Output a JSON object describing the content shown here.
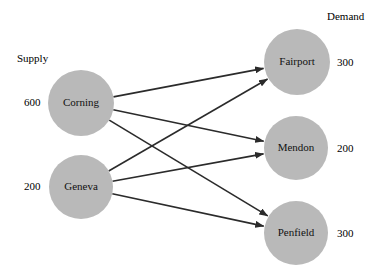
{
  "diagram": {
    "title_supply": "Supply",
    "title_demand": "Demand",
    "supply_nodes": [
      {
        "id": "corning",
        "label": "Corning",
        "value": "600",
        "cx": 81,
        "cy": 103,
        "r": 33
      },
      {
        "id": "geneva",
        "label": "Geneva",
        "value": "200",
        "cx": 81,
        "cy": 187,
        "r": 32
      }
    ],
    "demand_nodes": [
      {
        "id": "fairport",
        "label": "Fairport",
        "value": "300",
        "cx": 297,
        "cy": 62,
        "r": 33
      },
      {
        "id": "mendon",
        "label": "Mendon",
        "value": "200",
        "cx": 296,
        "cy": 148,
        "r": 32
      },
      {
        "id": "penfield",
        "label": "Penfield",
        "value": "300",
        "cx": 296,
        "cy": 233,
        "r": 32
      }
    ],
    "edges": [
      {
        "from": "corning",
        "to": "fairport"
      },
      {
        "from": "corning",
        "to": "mendon"
      },
      {
        "from": "corning",
        "to": "penfield"
      },
      {
        "from": "geneva",
        "to": "fairport"
      },
      {
        "from": "geneva",
        "to": "mendon"
      },
      {
        "from": "geneva",
        "to": "penfield"
      }
    ],
    "colors": {
      "node_fill": "#b9b9b9",
      "edge_stroke": "#2b2b2b",
      "text": "#111111",
      "background": "#ffffff"
    }
  }
}
